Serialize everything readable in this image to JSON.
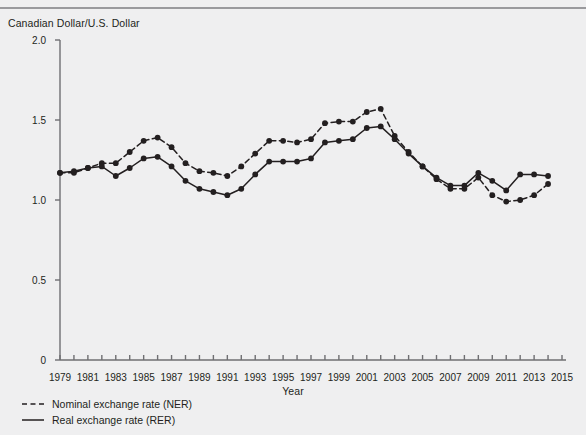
{
  "figure": {
    "y_axis_title": "Canadian Dollar/U.S. Dollar",
    "x_axis_title": "Year"
  },
  "legend": {
    "items": [
      {
        "label": "Nominal exchange rate (NER)",
        "style": "dashed",
        "color": "#231f20"
      },
      {
        "label": "Real exchange rate (RER)",
        "style": "solid",
        "color": "#231f20"
      }
    ]
  },
  "chart_data": {
    "type": "line",
    "title": "",
    "subtitle": "",
    "xlabel": "Year",
    "ylabel": "Canadian Dollar/U.S. Dollar",
    "xlim": [
      1979,
      2015
    ],
    "ylim": [
      0,
      2.0
    ],
    "y_ticks": [
      "0",
      "0.5",
      "1.0",
      "1.5",
      "2.0"
    ],
    "y_tick_values": [
      0,
      0.5,
      1.0,
      1.5,
      2.0
    ],
    "x_ticks": [
      "1979",
      "1981",
      "1983",
      "1985",
      "1987",
      "1989",
      "1991",
      "1993",
      "1995",
      "1997",
      "1999",
      "2001",
      "2003",
      "2005",
      "2007",
      "2009",
      "2011",
      "2013",
      "2015"
    ],
    "x_tick_values": [
      1979,
      1981,
      1983,
      1985,
      1987,
      1989,
      1991,
      1993,
      1995,
      1997,
      1999,
      2001,
      2003,
      2005,
      2007,
      2009,
      2011,
      2013,
      2015
    ],
    "x_minor_ticks": [
      1980,
      1982,
      1984,
      1986,
      1988,
      1990,
      1992,
      1994,
      1996,
      1998,
      2000,
      2002,
      2004,
      2006,
      2008,
      2010,
      2012,
      2014
    ],
    "grid": false,
    "legend_position": "below-left",
    "markers": "filled-circle",
    "x": [
      1979,
      1980,
      1981,
      1982,
      1983,
      1984,
      1985,
      1986,
      1987,
      1988,
      1989,
      1990,
      1991,
      1992,
      1993,
      1994,
      1995,
      1996,
      1997,
      1998,
      1999,
      2000,
      2001,
      2002,
      2003,
      2004,
      2005,
      2006,
      2007,
      2008,
      2009,
      2010,
      2011,
      2012,
      2013,
      2014
    ],
    "series": [
      {
        "name": "Nominal exchange rate (NER)",
        "style": "dashed",
        "color": "#231f20",
        "values": [
          1.17,
          1.17,
          1.2,
          1.23,
          1.23,
          1.3,
          1.37,
          1.39,
          1.33,
          1.23,
          1.18,
          1.17,
          1.15,
          1.21,
          1.29,
          1.37,
          1.37,
          1.36,
          1.38,
          1.48,
          1.49,
          1.49,
          1.55,
          1.57,
          1.4,
          1.3,
          1.21,
          1.13,
          1.07,
          1.07,
          1.14,
          1.03,
          0.99,
          1.0,
          1.03,
          1.1
        ]
      },
      {
        "name": "Real exchange rate (RER)",
        "style": "solid",
        "color": "#231f20",
        "values": [
          1.17,
          1.18,
          1.2,
          1.21,
          1.15,
          1.2,
          1.26,
          1.27,
          1.21,
          1.12,
          1.07,
          1.05,
          1.03,
          1.07,
          1.16,
          1.24,
          1.24,
          1.24,
          1.26,
          1.36,
          1.37,
          1.38,
          1.45,
          1.46,
          1.38,
          1.29,
          1.21,
          1.14,
          1.09,
          1.09,
          1.17,
          1.12,
          1.06,
          1.16,
          1.16,
          1.15
        ]
      }
    ]
  }
}
